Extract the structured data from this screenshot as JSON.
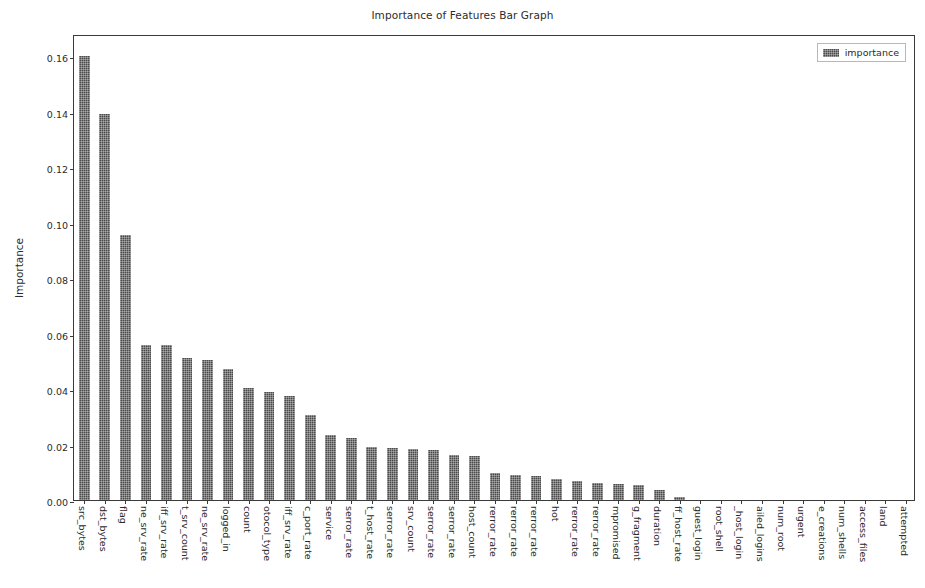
{
  "chart_data": {
    "type": "bar",
    "title": "Importance of Features Bar Graph",
    "xlabel": "",
    "ylabel": "Importance",
    "ylim": [
      0.0,
      0.168
    ],
    "yticks": [
      "0.00",
      "0.02",
      "0.04",
      "0.06",
      "0.08",
      "0.10",
      "0.12",
      "0.14",
      "0.16"
    ],
    "ytick_values": [
      0.0,
      0.02,
      0.04,
      0.06,
      0.08,
      0.1,
      0.12,
      0.14,
      0.16
    ],
    "grid": false,
    "legend": {
      "position": "upper right",
      "entries": [
        "importance"
      ]
    },
    "series": [
      {
        "name": "importance",
        "color": "#4a4a4a",
        "values": [
          0.16,
          0.139,
          0.0955,
          0.056,
          0.056,
          0.0512,
          0.0503,
          0.0474,
          0.0405,
          0.039,
          0.0376,
          0.0305,
          0.0233,
          0.0223,
          0.019,
          0.0186,
          0.0183,
          0.0182,
          0.0162,
          0.0157,
          0.0098,
          0.0089,
          0.0088,
          0.0074,
          0.007,
          0.0062,
          0.0058,
          0.0055,
          0.0035,
          0.001,
          0.0,
          0.0,
          0.0,
          0.0,
          0.0,
          0.0,
          0.0,
          0.0,
          0.0,
          0.0,
          0.0
        ]
      }
    ],
    "categories": [
      "src_bytes",
      "dst_bytes",
      "flag",
      "ne_srv_rate",
      "iff_srv_rate",
      "t_srv_count",
      "ne_srv_rate",
      "logged_in",
      "count",
      "otocol_type",
      "iff_srv_rate",
      "c_port_rate",
      "service",
      "serror_rate",
      "t_host_rate",
      "serror_rate",
      "srv_count",
      "serror_rate",
      "serror_rate",
      "host_count",
      "rerror_rate",
      "rerror_rate",
      "rerror_rate",
      "hot",
      "rerror_rate",
      "rerror_rate",
      "mpromised",
      "g_fragment",
      "duration",
      "ff_host_rate",
      "guest_login",
      "root_shell",
      "_host_login",
      "ailed_logins",
      "num_root",
      "urgent",
      "e_creations",
      "num_shells",
      "access_files",
      "land",
      "attempted"
    ]
  }
}
